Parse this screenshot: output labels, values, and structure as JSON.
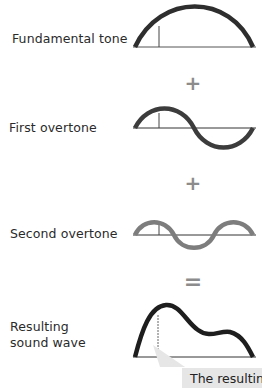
{
  "labels": {
    "fundamental": "Fundamental tone",
    "first_overtone": "First overtone",
    "second_overtone": "Second overtone",
    "resulting_line1": "Resulting",
    "resulting_line2": "sound wave"
  },
  "operators": {
    "plus1": "+",
    "plus2": "+",
    "equals": "="
  },
  "callout": {
    "text": "The resulting sound wave"
  },
  "colors": {
    "fundamental_wave": "#2e2e2e",
    "first_overtone_wave": "#3c3c3c",
    "second_overtone_wave": "#7d7d7d",
    "resulting_wave": "#1e1e1e",
    "operator": "#8c8c8c",
    "callout_bg": "#e6e6e6"
  }
}
